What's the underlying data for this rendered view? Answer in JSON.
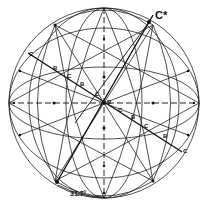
{
  "diagram": {
    "type": "stereographic-projection",
    "labels": {
      "pole_top_right": "C*",
      "angle": "31.7°",
      "c": "C",
      "b": "B"
    },
    "diagonal_labels": [
      {
        "text": "C",
        "x": 30,
        "y": 55
      },
      {
        "text": "B",
        "x": 53,
        "y": 68
      },
      {
        "text": "C",
        "x": 68,
        "y": 77
      },
      {
        "text": "B",
        "x": 80,
        "y": 85
      },
      {
        "text": "C",
        "x": 96,
        "y": 95
      },
      {
        "text": "B",
        "x": 109,
        "y": 103
      },
      {
        "text": "C",
        "x": 121,
        "y": 111
      },
      {
        "text": "B",
        "x": 133,
        "y": 118
      },
      {
        "text": "C",
        "x": 146,
        "y": 127
      },
      {
        "text": "B",
        "x": 165,
        "y": 137
      },
      {
        "text": "C",
        "x": 184,
        "y": 151
      }
    ],
    "colors": {
      "ink": "#111111",
      "background": "#ffffff"
    }
  }
}
